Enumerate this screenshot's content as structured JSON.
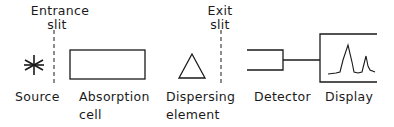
{
  "diagram": {
    "components": [
      {
        "id": "source",
        "label": "Source",
        "icon": "asterisk-icon"
      },
      {
        "id": "entrance-slit",
        "label_line1": "Entrance",
        "label_line2": "slit"
      },
      {
        "id": "absorption-cell",
        "label_line1": "Absorption",
        "label_line2": "cell"
      },
      {
        "id": "dispersing-element",
        "label_line1": "Dispersing",
        "label_line2": "element",
        "icon": "triangle-icon"
      },
      {
        "id": "exit-slit",
        "label_line1": "Exit",
        "label_line2": "slit"
      },
      {
        "id": "detector",
        "label": "Detector"
      },
      {
        "id": "display",
        "label": "Display",
        "icon": "spectrum-peaks-icon"
      }
    ]
  },
  "colors": {
    "stroke": "#1a1a1a",
    "background": "#ffffff"
  }
}
